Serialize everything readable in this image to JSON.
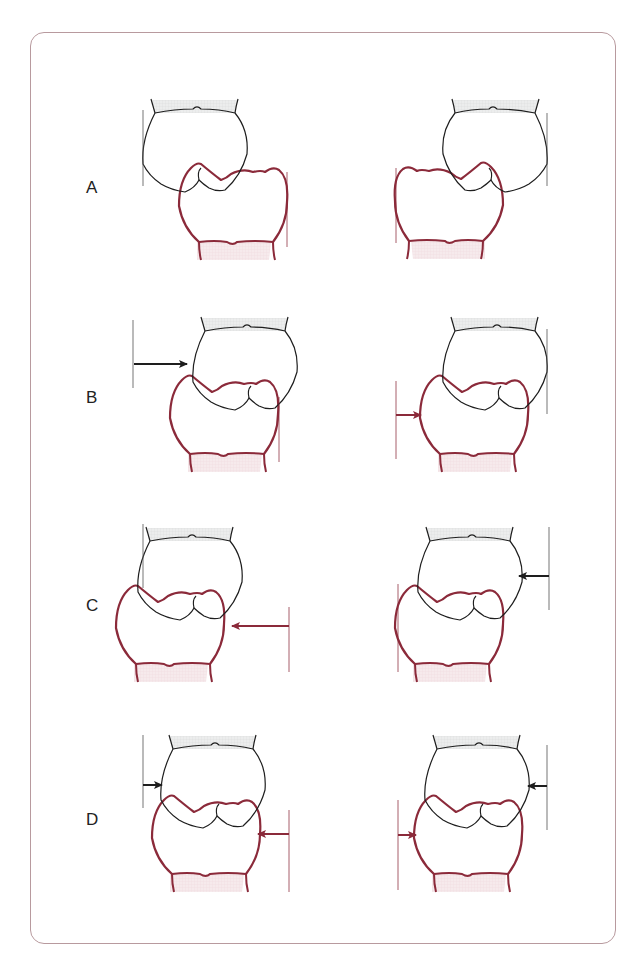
{
  "figure": {
    "colors": {
      "frame": "#b89a9e",
      "upper_tooth": "#1e1e1e",
      "lower_tooth": "#8b2a3a",
      "guide_line_black": "#555555",
      "guide_line_red": "#8b2a3a",
      "root_fill_upper": "#e9eaea",
      "root_fill_lower": "#f4e6e8"
    },
    "rows": [
      {
        "label": "A",
        "label_pos": [
          88,
          190
        ],
        "panels": [
          {
            "side": "left",
            "upper": [
              195,
              100
            ],
            "lower": [
              233,
              168
            ],
            "upper_flip": false,
            "lower_flip": false,
            "guides": [
              {
                "x": 143,
                "y1": 110,
                "y2": 186,
                "color": "black"
              },
              {
                "x": 287,
                "y1": 172,
                "y2": 247,
                "color": "red"
              }
            ],
            "arrows": []
          },
          {
            "side": "right",
            "upper": [
              495,
              100
            ],
            "lower": [
              449,
              167
            ],
            "upper_flip": true,
            "lower_flip": true,
            "guides": [
              {
                "x": 547,
                "y1": 113,
                "y2": 186,
                "color": "black"
              },
              {
                "x": 396,
                "y1": 168,
                "y2": 243,
                "color": "red"
              }
            ],
            "arrows": []
          }
        ]
      },
      {
        "label": "B",
        "label_pos": [
          88,
          400
        ],
        "panels": [
          {
            "side": "left",
            "upper": [
              245,
              318
            ],
            "lower": [
              224,
              380
            ],
            "upper_flip": false,
            "lower_flip": false,
            "guides": [
              {
                "x": 133,
                "y1": 320,
                "y2": 388,
                "color": "black"
              },
              {
                "x": 279,
                "y1": 397,
                "y2": 462,
                "color": "red"
              }
            ],
            "arrows": [
              {
                "x1": 134,
                "x2": 187,
                "y": 364,
                "color": "black",
                "size": "large"
              }
            ]
          },
          {
            "side": "right",
            "upper": [
              495,
              318
            ],
            "lower": [
              474,
              380
            ],
            "upper_flip": false,
            "lower_flip": false,
            "guides": [
              {
                "x": 547,
                "y1": 329,
                "y2": 414,
                "color": "black"
              },
              {
                "x": 396,
                "y1": 381,
                "y2": 459,
                "color": "red"
              }
            ],
            "arrows": [
              {
                "x1": 396,
                "x2": 421,
                "y": 415,
                "color": "red",
                "size": "small"
              }
            ]
          }
        ]
      },
      {
        "label": "C",
        "label_pos": [
          88,
          608
        ],
        "panels": [
          {
            "side": "left",
            "upper": [
              190,
              528
            ],
            "lower": [
              170,
              590
            ],
            "upper_flip": false,
            "lower_flip": false,
            "guides": [
              {
                "x": 143,
                "y1": 524,
                "y2": 588,
                "color": "black"
              },
              {
                "x": 289,
                "y1": 607,
                "y2": 672,
                "color": "red"
              }
            ],
            "arrows": [
              {
                "x1": 289,
                "x2": 232,
                "y": 626,
                "color": "red",
                "size": "large"
              }
            ]
          },
          {
            "side": "right",
            "upper": [
              470,
              528
            ],
            "lower": [
              449,
              590
            ],
            "upper_flip": false,
            "lower_flip": false,
            "guides": [
              {
                "x": 549,
                "y1": 527,
                "y2": 610,
                "color": "black"
              },
              {
                "x": 398,
                "y1": 584,
                "y2": 672,
                "color": "red"
              }
            ],
            "arrows": [
              {
                "x1": 549,
                "x2": 519,
                "y": 576,
                "color": "black",
                "size": "small"
              }
            ]
          }
        ]
      },
      {
        "label": "D",
        "label_pos": [
          88,
          822
        ],
        "panels": [
          {
            "side": "left",
            "upper": [
              213,
              736
            ],
            "lower": [
              206,
              800
            ],
            "upper_flip": false,
            "lower_flip": false,
            "guides": [
              {
                "x": 143,
                "y1": 735,
                "y2": 808,
                "color": "black"
              },
              {
                "x": 289,
                "y1": 810,
                "y2": 892,
                "color": "red"
              }
            ],
            "arrows": [
              {
                "x1": 143,
                "x2": 162,
                "y": 785,
                "color": "black",
                "size": "small"
              },
              {
                "x1": 289,
                "x2": 258,
                "y": 834,
                "color": "red",
                "size": "small"
              }
            ]
          },
          {
            "side": "right",
            "upper": [
              477,
              736
            ],
            "lower": [
              468,
              800
            ],
            "upper_flip": false,
            "lower_flip": false,
            "guides": [
              {
                "x": 547,
                "y1": 745,
                "y2": 830,
                "color": "black"
              },
              {
                "x": 398,
                "y1": 800,
                "y2": 890,
                "color": "red"
              }
            ],
            "arrows": [
              {
                "x1": 547,
                "x2": 528,
                "y": 786,
                "color": "black",
                "size": "small"
              },
              {
                "x1": 398,
                "x2": 416,
                "y": 835,
                "color": "red",
                "size": "small"
              }
            ]
          }
        ]
      }
    ]
  }
}
